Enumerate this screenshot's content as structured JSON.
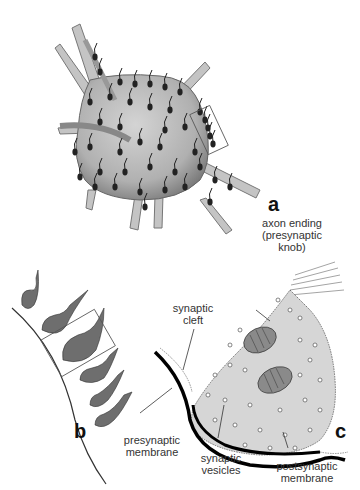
{
  "figure": {
    "panels": {
      "a": "a",
      "b": "b",
      "c": "c"
    },
    "labels": {
      "axon_ending_1": "axon ending",
      "axon_ending_2": "(presynaptic",
      "axon_ending_3": "knob)",
      "synaptic_cleft_1": "synaptic",
      "synaptic_cleft_2": "cleft",
      "presynaptic_membrane_1": "presynaptic",
      "presynaptic_membrane_2": "membrane",
      "synaptic_vesicles_1": "synaptic",
      "synaptic_vesicles_2": "vesicles",
      "postsynaptic_membrane_1": "postsynaptic",
      "postsynaptic_membrane_2": "membrane"
    },
    "colors": {
      "cell_fill": "#c8c8c8",
      "cell_dark": "#6a6a6a",
      "knob": "#222222",
      "membrane": "#000000",
      "knob_fill": "#d6d6d6"
    }
  }
}
